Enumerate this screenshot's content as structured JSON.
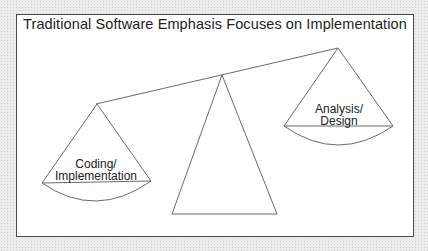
{
  "title": "Traditional Software Emphasis Focuses on Implementation",
  "scale": {
    "left_pan": {
      "label_line1": "Coding/",
      "label_line2": "Implementation",
      "position": "low"
    },
    "right_pan": {
      "label_line1": "Analysis/",
      "label_line2": "Design",
      "position": "high"
    },
    "fulcrum": "triangle"
  },
  "colors": {
    "line": "#6a6a6a",
    "frame": "#4a4a4a",
    "text": "#222222",
    "background": "#ececec"
  }
}
